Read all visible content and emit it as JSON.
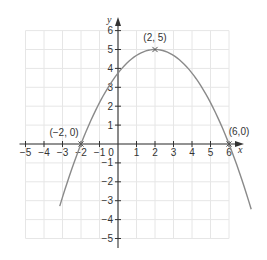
{
  "chart_data": {
    "type": "line",
    "title": "",
    "xlabel": "x",
    "ylabel": "y",
    "xlim": [
      -5,
      6
    ],
    "ylim": [
      -5,
      6
    ],
    "grid": true,
    "x_ticks": [
      -5,
      -4,
      -3,
      -2,
      -1,
      0,
      1,
      2,
      3,
      4,
      5,
      6
    ],
    "x_tick_labels": [
      "−5",
      "−4",
      "−3",
      "−2",
      "−1",
      "0",
      "1",
      "2",
      "3",
      "4",
      "5",
      "6"
    ],
    "y_ticks": [
      -5,
      -4,
      -3,
      -2,
      -1,
      1,
      2,
      3,
      4,
      5,
      6
    ],
    "y_tick_labels": [
      "−5",
      "−4",
      "−3",
      "−2",
      "−1",
      "1",
      "2",
      "3",
      "4",
      "5",
      "6"
    ],
    "series": [
      {
        "name": "parabola",
        "equation": "y = -5/16 (x - 2)^2 + 5",
        "x_range": [
          -3.15,
          7.2
        ],
        "x": [
          -3,
          -2,
          -1,
          0,
          1,
          2,
          3,
          4,
          5,
          6,
          7
        ],
        "y": [
          -3.28,
          0,
          2.19,
          3.75,
          4.69,
          5,
          4.69,
          3.75,
          2.19,
          0,
          -2.81
        ]
      }
    ],
    "annotations": [
      {
        "label": "(−2, 0)",
        "x": -2,
        "y": 0,
        "marker": "cross"
      },
      {
        "label": "(2, 5)",
        "x": 2,
        "y": 5,
        "marker": "cross"
      },
      {
        "label": "(6,0)",
        "x": 6,
        "y": 0,
        "marker": "cross"
      }
    ],
    "colors": {
      "curve": "#8a8a8a",
      "axis": "#333333",
      "grid": "#e6e6e6",
      "text": "#333333"
    }
  }
}
